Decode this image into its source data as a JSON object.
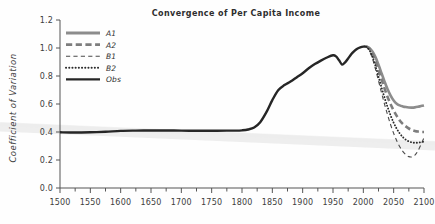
{
  "figure": {
    "name": "convergence-of-per-capita-income-chart",
    "background": "#fefefe"
  },
  "chart_data": {
    "type": "line",
    "title": "Convergence of Per Capita Income",
    "xlabel": "",
    "ylabel": "Coefficient of Variation",
    "xlim": [
      1500,
      2100
    ],
    "ylim": [
      0.0,
      1.2
    ],
    "xticks": [
      1500,
      1550,
      1600,
      1650,
      1700,
      1750,
      1800,
      1850,
      1900,
      1950,
      2000,
      2050,
      2100
    ],
    "xtick_labels": [
      "1500",
      "1550",
      "1600",
      "1650",
      "1700",
      "1750",
      "1800",
      "1850",
      "1900",
      "1950",
      "2000",
      "2050",
      "2100"
    ],
    "yticks": [
      0.0,
      0.2,
      0.4,
      0.6,
      0.8,
      1.0,
      1.2
    ],
    "ytick_labels": [
      "0.0",
      "0.2",
      "0.4",
      "0.6",
      "0.8",
      "1.0",
      "1.2"
    ],
    "minor_xtick_step": 25,
    "grid": false,
    "legend_position": "top-left",
    "series": [
      {
        "name": "A1",
        "style": "solid",
        "color": "#8c8c8c",
        "width": 2.6,
        "points": [
          [
            2005,
            1.01
          ],
          [
            2010,
            1.0
          ],
          [
            2015,
            0.975
          ],
          [
            2020,
            0.935
          ],
          [
            2025,
            0.88
          ],
          [
            2030,
            0.82
          ],
          [
            2035,
            0.76
          ],
          [
            2040,
            0.705
          ],
          [
            2045,
            0.66
          ],
          [
            2050,
            0.625
          ],
          [
            2055,
            0.602
          ],
          [
            2060,
            0.59
          ],
          [
            2065,
            0.583
          ],
          [
            2070,
            0.578
          ],
          [
            2075,
            0.575
          ],
          [
            2080,
            0.574
          ],
          [
            2085,
            0.576
          ],
          [
            2090,
            0.58
          ],
          [
            2095,
            0.585
          ],
          [
            2100,
            0.59
          ]
        ]
      },
      {
        "name": "A2",
        "style": "dashed",
        "color": "#7d7d7d",
        "width": 2.6,
        "points": [
          [
            2005,
            1.01
          ],
          [
            2010,
            0.995
          ],
          [
            2015,
            0.96
          ],
          [
            2020,
            0.905
          ],
          [
            2025,
            0.84
          ],
          [
            2030,
            0.775
          ],
          [
            2035,
            0.71
          ],
          [
            2040,
            0.65
          ],
          [
            2045,
            0.598
          ],
          [
            2050,
            0.553
          ],
          [
            2055,
            0.515
          ],
          [
            2060,
            0.482
          ],
          [
            2065,
            0.458
          ],
          [
            2070,
            0.44
          ],
          [
            2075,
            0.425
          ],
          [
            2080,
            0.415
          ],
          [
            2085,
            0.408
          ],
          [
            2090,
            0.403
          ],
          [
            2095,
            0.4
          ],
          [
            2100,
            0.4
          ]
        ]
      },
      {
        "name": "B1",
        "style": "dashed-thin",
        "color": "#4a4a4a",
        "width": 1.1,
        "points": [
          [
            2005,
            1.01
          ],
          [
            2010,
            0.98
          ],
          [
            2015,
            0.925
          ],
          [
            2020,
            0.85
          ],
          [
            2025,
            0.765
          ],
          [
            2030,
            0.68
          ],
          [
            2035,
            0.598
          ],
          [
            2040,
            0.522
          ],
          [
            2045,
            0.452
          ],
          [
            2050,
            0.39
          ],
          [
            2055,
            0.338
          ],
          [
            2060,
            0.295
          ],
          [
            2065,
            0.262
          ],
          [
            2070,
            0.238
          ],
          [
            2075,
            0.224
          ],
          [
            2080,
            0.222
          ],
          [
            2085,
            0.235
          ],
          [
            2090,
            0.265
          ],
          [
            2095,
            0.31
          ],
          [
            2100,
            0.36
          ]
        ]
      },
      {
        "name": "B2",
        "style": "dotted",
        "color": "#2b2b2b",
        "width": 1.9,
        "points": [
          [
            2005,
            1.01
          ],
          [
            2010,
            0.985
          ],
          [
            2015,
            0.938
          ],
          [
            2020,
            0.872
          ],
          [
            2025,
            0.795
          ],
          [
            2030,
            0.718
          ],
          [
            2035,
            0.645
          ],
          [
            2040,
            0.578
          ],
          [
            2045,
            0.518
          ],
          [
            2050,
            0.466
          ],
          [
            2055,
            0.424
          ],
          [
            2060,
            0.39
          ],
          [
            2065,
            0.364
          ],
          [
            2070,
            0.345
          ],
          [
            2075,
            0.333
          ],
          [
            2080,
            0.326
          ],
          [
            2085,
            0.323
          ],
          [
            2090,
            0.324
          ],
          [
            2095,
            0.327
          ],
          [
            2100,
            0.332
          ]
        ]
      },
      {
        "name": "Obs",
        "style": "solid",
        "color": "#262626",
        "width": 2.4,
        "points": [
          [
            1500,
            0.398
          ],
          [
            1525,
            0.396
          ],
          [
            1550,
            0.398
          ],
          [
            1575,
            0.402
          ],
          [
            1600,
            0.408
          ],
          [
            1625,
            0.41
          ],
          [
            1650,
            0.411
          ],
          [
            1675,
            0.411
          ],
          [
            1700,
            0.41
          ],
          [
            1725,
            0.409
          ],
          [
            1750,
            0.409
          ],
          [
            1775,
            0.41
          ],
          [
            1790,
            0.41
          ],
          [
            1800,
            0.412
          ],
          [
            1810,
            0.418
          ],
          [
            1820,
            0.432
          ],
          [
            1830,
            0.47
          ],
          [
            1840,
            0.54
          ],
          [
            1850,
            0.628
          ],
          [
            1860,
            0.7
          ],
          [
            1870,
            0.735
          ],
          [
            1880,
            0.76
          ],
          [
            1890,
            0.79
          ],
          [
            1900,
            0.82
          ],
          [
            1910,
            0.855
          ],
          [
            1920,
            0.885
          ],
          [
            1930,
            0.91
          ],
          [
            1940,
            0.932
          ],
          [
            1950,
            0.948
          ],
          [
            1955,
            0.94
          ],
          [
            1960,
            0.912
          ],
          [
            1965,
            0.882
          ],
          [
            1970,
            0.898
          ],
          [
            1975,
            0.925
          ],
          [
            1980,
            0.955
          ],
          [
            1985,
            0.978
          ],
          [
            1990,
            0.995
          ],
          [
            1995,
            1.005
          ],
          [
            2000,
            1.01
          ],
          [
            2005,
            1.01
          ]
        ]
      }
    ],
    "legend": [
      {
        "label": "A1",
        "style": "solid",
        "color": "#8c8c8c",
        "width": 2.8
      },
      {
        "label": "A2",
        "style": "dashed",
        "color": "#7d7d7d",
        "width": 2.8
      },
      {
        "label": "B1",
        "style": "dashed-thin",
        "color": "#4a4a4a",
        "width": 1.1
      },
      {
        "label": "B2",
        "style": "dotted",
        "color": "#2b2b2b",
        "width": 2.0
      },
      {
        "label": "Obs",
        "style": "solid",
        "color": "#262626",
        "width": 2.4
      }
    ],
    "artifacts": [
      {
        "name": "scan-streak",
        "color": "#ededed",
        "description": "faint light grey diagonal band across image"
      }
    ]
  }
}
